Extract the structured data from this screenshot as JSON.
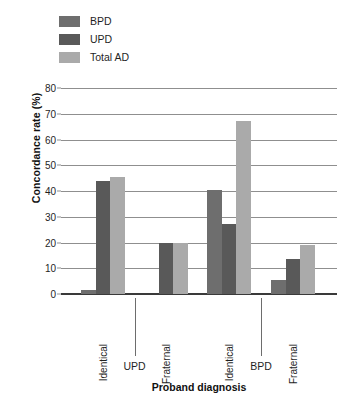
{
  "chart_data": {
    "type": "bar",
    "title": "",
    "xlabel": "Proband diagnosis",
    "ylabel": "Concordance rate (%)",
    "ylim": [
      0,
      80
    ],
    "yticks": [
      0,
      10,
      20,
      30,
      40,
      50,
      60,
      70,
      80
    ],
    "grid": true,
    "legend_position": "top-left",
    "categories": [
      "Identical",
      "Fraternal",
      "Identical",
      "Fraternal"
    ],
    "group_labels": [
      "UPD",
      "BPD"
    ],
    "series": [
      {
        "name": "BPD",
        "color": "#6e6e6e",
        "values": [
          1.5,
          0,
          40.5,
          5.5
        ]
      },
      {
        "name": "UPD",
        "color": "#595959",
        "values": [
          44,
          20,
          27,
          13.5
        ]
      },
      {
        "name": "Total AD",
        "color": "#aaaaaa",
        "values": [
          45.5,
          20,
          67,
          19
        ]
      }
    ]
  },
  "legend": {
    "items": [
      {
        "label": "BPD",
        "color": "#6e6e6e"
      },
      {
        "label": "UPD",
        "color": "#595959"
      },
      {
        "label": "Total AD",
        "color": "#aaaaaa"
      }
    ]
  },
  "axes": {
    "y_title": "Concordance rate (%)",
    "x_title": "Proband diagnosis",
    "y_ticks": [
      "0",
      "10",
      "20",
      "30",
      "40",
      "50",
      "60",
      "70",
      "80"
    ],
    "x_categories": [
      "Identical",
      "Fraternal",
      "Identical",
      "Fraternal"
    ],
    "x_groups": [
      "UPD",
      "BPD"
    ]
  }
}
